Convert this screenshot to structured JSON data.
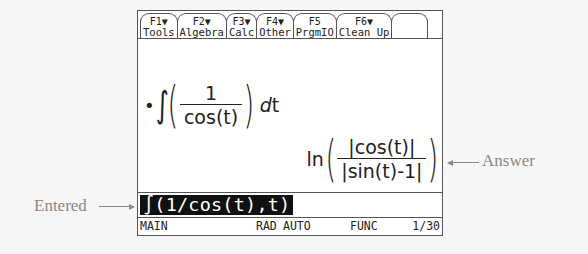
{
  "toolbar": {
    "tabs": [
      {
        "fkey": "F1▼",
        "label": "Tools"
      },
      {
        "fkey": "F2▼",
        "label": "Algebra"
      },
      {
        "fkey": "F3▼",
        "label": "Calc"
      },
      {
        "fkey": "F4▼",
        "label": "Other"
      },
      {
        "fkey": "F5",
        "label": "PrgmIO"
      },
      {
        "fkey": "F6▼",
        "label": "Clean Up"
      },
      {
        "fkey": "",
        "label": ""
      }
    ]
  },
  "history": {
    "entry": {
      "bullet": "•",
      "integral_sign": "∫",
      "numerator": "1",
      "denominator": "cos(t)",
      "differential_d": "d",
      "differential_var": "t"
    },
    "answer": {
      "function": "ln",
      "numerator": "|cos(t)|",
      "denominator": "|sin(t)-1|"
    }
  },
  "entry_line": {
    "text": "∫(1/cos(t),t)"
  },
  "status_bar": {
    "folder": "MAIN",
    "angle_mode": "RAD",
    "exact_mode": "AUTO",
    "graph_mode": "FUNC",
    "history_count": "1/30"
  },
  "annotations": {
    "entered_label": "Entered",
    "answer_label": "Answer"
  }
}
